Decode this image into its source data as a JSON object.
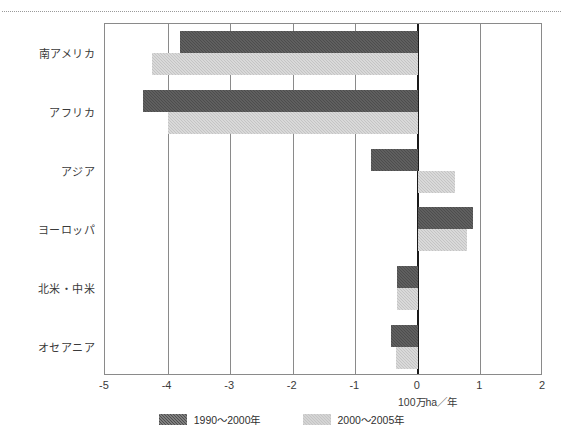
{
  "figure": {
    "top_caption": "",
    "xaxis_title": "100万ha／年"
  },
  "legend": {
    "items": [
      {
        "label": "1990〜2000年",
        "color": "#4d4d4d",
        "swatch_name": "legend-swatch-1990-2000"
      },
      {
        "label": "2000〜2005年",
        "color": "#c4c4c4",
        "swatch_name": "legend-swatch-2000-2005"
      }
    ]
  },
  "chart_data": {
    "type": "bar",
    "orientation": "horizontal",
    "title": "",
    "xlabel": "100万ha／年",
    "ylabel": "",
    "xlim": [
      -5,
      2
    ],
    "xticks": [
      "-5",
      "-4",
      "-3",
      "-2",
      "-1",
      "0",
      "1",
      "2"
    ],
    "grid": true,
    "zero_line": 0,
    "legend_position": "bottom-center",
    "categories": [
      "南アメリカ",
      "アフリカ",
      "アジア",
      "ヨーロッパ",
      "北米・中米",
      "オセアニア"
    ],
    "series": [
      {
        "name": "1990〜2000年",
        "color": "#4d4d4d",
        "values": [
          -3.8,
          -4.4,
          -0.75,
          0.88,
          -0.33,
          -0.43
        ]
      },
      {
        "name": "2000〜2005年",
        "color": "#c4c4c4",
        "values": [
          -4.25,
          -4.0,
          0.6,
          0.79,
          -0.33,
          -0.35
        ]
      }
    ]
  }
}
